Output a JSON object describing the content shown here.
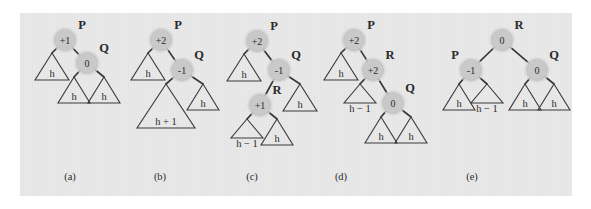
{
  "figure": {
    "background_color": "#e9e9e9",
    "page_color": "#ffffff",
    "node_fill": "#c9c9c9",
    "ink_color": "#2b2b2b"
  },
  "panels": [
    {
      "caption": "(a)",
      "caption_x": 70,
      "caption_y": 180,
      "nodes": [
        {
          "name": "P",
          "balance": "+1",
          "label": "P",
          "cx": 65,
          "cy": 40,
          "label_x": 82,
          "label_y": 29
        },
        {
          "name": "Q",
          "balance": "0",
          "label": "Q",
          "cx": 87,
          "cy": 63,
          "label_x": 104,
          "label_y": 52
        }
      ],
      "edges": [
        {
          "from": "P",
          "to": "tri-h-left"
        },
        {
          "from": "P",
          "to": "Q"
        },
        {
          "from": "Q",
          "to": "tri-h-ql"
        },
        {
          "from": "Q",
          "to": "tri-h-qr"
        }
      ],
      "triangles": [
        {
          "label": "h",
          "apex_x": 52,
          "apex_y": 53,
          "half_width": 17,
          "height": 27,
          "label_x": 52,
          "label_y": 77
        },
        {
          "label": "h",
          "apex_x": 74,
          "apex_y": 77,
          "half_width": 16,
          "height": 26,
          "label_x": 74,
          "label_y": 100
        },
        {
          "label": "h",
          "apex_x": 104,
          "apex_y": 77,
          "half_width": 16,
          "height": 26,
          "label_x": 104,
          "label_y": 100
        }
      ]
    },
    {
      "caption": "(b)",
      "caption_x": 160,
      "caption_y": 180,
      "nodes": [
        {
          "name": "P",
          "balance": "+2",
          "label": "P",
          "cx": 161,
          "cy": 40,
          "label_x": 178,
          "label_y": 29
        },
        {
          "name": "Q",
          "balance": "-1",
          "label": "Q",
          "cx": 182,
          "cy": 70,
          "label_x": 199,
          "label_y": 59
        }
      ],
      "edges": [
        {
          "from": "P",
          "to": "tri-h-left"
        },
        {
          "from": "P",
          "to": "Q"
        },
        {
          "from": "Q",
          "to": "tri-h1"
        },
        {
          "from": "Q",
          "to": "tri-h-right"
        }
      ],
      "triangles": [
        {
          "label": "h",
          "apex_x": 148,
          "apex_y": 53,
          "half_width": 17,
          "height": 27,
          "label_x": 148,
          "label_y": 77
        },
        {
          "label": "h + 1",
          "apex_x": 166,
          "apex_y": 84,
          "half_width": 29,
          "height": 44,
          "label_x": 166,
          "label_y": 125
        },
        {
          "label": "h",
          "apex_x": 203,
          "apex_y": 84,
          "half_width": 16,
          "height": 26,
          "label_x": 203,
          "label_y": 107
        }
      ]
    },
    {
      "caption": "(c)",
      "caption_x": 252,
      "caption_y": 180,
      "nodes": [
        {
          "name": "P",
          "balance": "+2",
          "label": "P",
          "cx": 257,
          "cy": 41,
          "label_x": 274,
          "label_y": 30
        },
        {
          "name": "Q",
          "balance": "-1",
          "label": "Q",
          "cx": 279,
          "cy": 70,
          "label_x": 296,
          "label_y": 59
        },
        {
          "name": "R",
          "balance": "+1",
          "label": "R",
          "cx": 260,
          "cy": 105,
          "label_x": 277,
          "label_y": 94
        }
      ],
      "edges": [
        {
          "from": "P",
          "to": "tri-h-left"
        },
        {
          "from": "P",
          "to": "Q"
        },
        {
          "from": "Q",
          "to": "R"
        },
        {
          "from": "Q",
          "to": "tri-h-right"
        },
        {
          "from": "R",
          "to": "tri-hm1"
        },
        {
          "from": "R",
          "to": "tri-h-mid"
        }
      ],
      "triangles": [
        {
          "label": "h",
          "apex_x": 244,
          "apex_y": 54,
          "half_width": 17,
          "height": 27,
          "label_x": 244,
          "label_y": 78
        },
        {
          "label": "h",
          "apex_x": 300,
          "apex_y": 84,
          "half_width": 17,
          "height": 27,
          "label_x": 300,
          "label_y": 108
        },
        {
          "label": "h − 1",
          "apex_x": 247,
          "apex_y": 119,
          "half_width": 16,
          "height": 19,
          "label_x": 247,
          "label_y": 147
        },
        {
          "label": "h",
          "apex_x": 277,
          "apex_y": 119,
          "half_width": 16,
          "height": 26,
          "label_x": 277,
          "label_y": 142
        }
      ]
    },
    {
      "caption": "(d)",
      "caption_x": 341,
      "caption_y": 180,
      "nodes": [
        {
          "name": "P",
          "balance": "+2",
          "label": "P",
          "cx": 354,
          "cy": 40,
          "label_x": 371,
          "label_y": 29
        },
        {
          "name": "R",
          "balance": "+2",
          "label": "R",
          "cx": 373,
          "cy": 70,
          "label_x": 390,
          "label_y": 59
        },
        {
          "name": "Q",
          "balance": "0",
          "label": "Q",
          "cx": 393,
          "cy": 103,
          "label_x": 410,
          "label_y": 92
        }
      ],
      "edges": [
        {
          "from": "P",
          "to": "tri-h-left"
        },
        {
          "from": "P",
          "to": "R"
        },
        {
          "from": "R",
          "to": "tri-hm1"
        },
        {
          "from": "R",
          "to": "Q"
        },
        {
          "from": "Q",
          "to": "tri-h-ql"
        },
        {
          "from": "Q",
          "to": "tri-h-qr"
        }
      ],
      "triangles": [
        {
          "label": "h",
          "apex_x": 341,
          "apex_y": 53,
          "half_width": 17,
          "height": 27,
          "label_x": 341,
          "label_y": 77
        },
        {
          "label": "h − 1",
          "apex_x": 360,
          "apex_y": 84,
          "half_width": 16,
          "height": 19,
          "label_x": 360,
          "label_y": 112
        },
        {
          "label": "h",
          "apex_x": 381,
          "apex_y": 117,
          "half_width": 16,
          "height": 26,
          "label_x": 381,
          "label_y": 140
        },
        {
          "label": "h",
          "apex_x": 411,
          "apex_y": 117,
          "half_width": 16,
          "height": 26,
          "label_x": 411,
          "label_y": 140
        }
      ]
    },
    {
      "caption": "(e)",
      "caption_x": 472,
      "caption_y": 180,
      "nodes": [
        {
          "name": "R",
          "balance": "0",
          "label": "R",
          "cx": 502,
          "cy": 40,
          "label_x": 519,
          "label_y": 29
        },
        {
          "name": "P",
          "balance": "-1",
          "label": "P",
          "cx": 471,
          "cy": 70,
          "label_x": 455,
          "label_y": 59
        },
        {
          "name": "Q",
          "balance": "0",
          "label": "Q",
          "cx": 537,
          "cy": 70,
          "label_x": 554,
          "label_y": 59
        }
      ],
      "edges": [
        {
          "from": "R",
          "to": "P"
        },
        {
          "from": "R",
          "to": "Q"
        },
        {
          "from": "P",
          "to": "tri-h-pl"
        },
        {
          "from": "P",
          "to": "tri-hm1"
        },
        {
          "from": "Q",
          "to": "tri-h-ql"
        },
        {
          "from": "Q",
          "to": "tri-h-qr"
        }
      ],
      "triangles": [
        {
          "label": "h",
          "apex_x": 459,
          "apex_y": 84,
          "half_width": 16,
          "height": 26,
          "label_x": 459,
          "label_y": 107
        },
        {
          "label": "h − 1",
          "apex_x": 487,
          "apex_y": 84,
          "half_width": 16,
          "height": 19,
          "label_x": 487,
          "label_y": 112
        },
        {
          "label": "h",
          "apex_x": 525,
          "apex_y": 84,
          "half_width": 16,
          "height": 26,
          "label_x": 525,
          "label_y": 107
        },
        {
          "label": "h",
          "apex_x": 554,
          "apex_y": 84,
          "half_width": 16,
          "height": 26,
          "label_x": 554,
          "label_y": 107
        }
      ]
    }
  ]
}
